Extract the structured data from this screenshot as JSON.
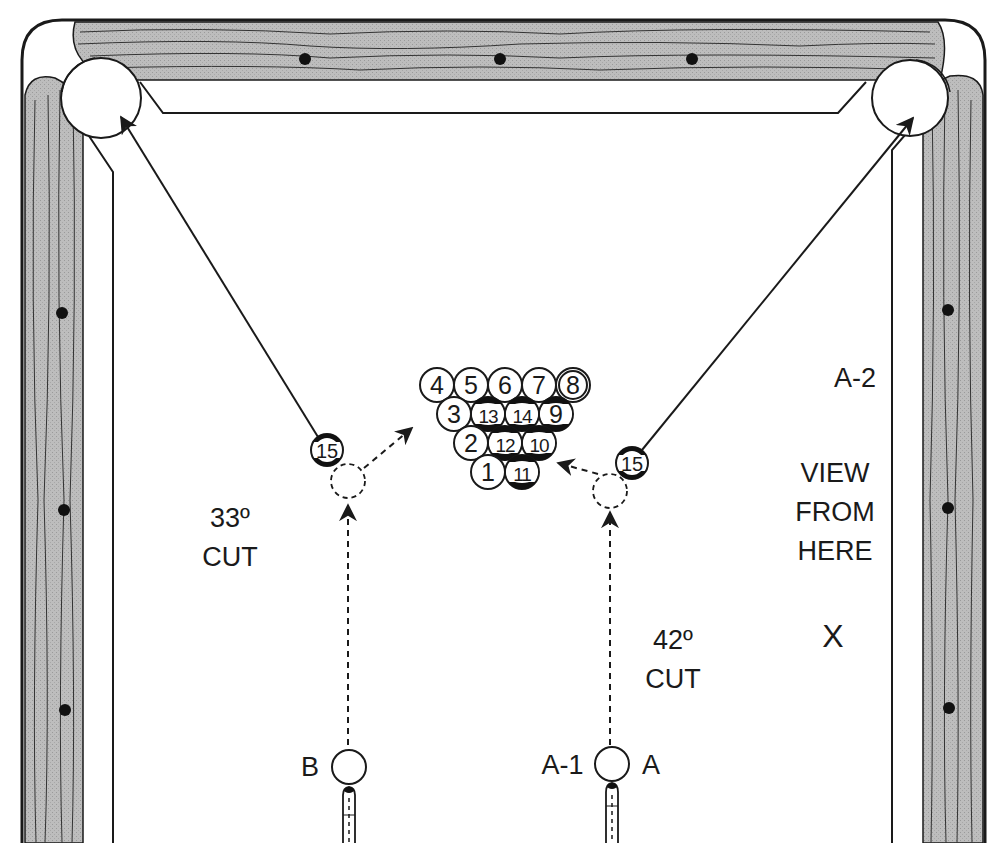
{
  "diagram": {
    "rack": {
      "rows": [
        [
          "4",
          "5",
          "6",
          "7",
          "8"
        ],
        [
          "3",
          "13",
          "14",
          "9"
        ],
        [
          "2",
          "12",
          "10"
        ],
        [
          "1",
          "11"
        ]
      ],
      "stripes": [
        "9",
        "10",
        "11",
        "12",
        "13",
        "14",
        "15"
      ],
      "eight_ball": "8"
    },
    "object_ball_left": {
      "number": "15"
    },
    "object_ball_right": {
      "number": "15"
    },
    "labels": {
      "a2": "A-2",
      "view_line1": "VIEW",
      "view_line2": "FROM",
      "view_line3": "HERE",
      "view_marker": "X",
      "cut_left_angle": "33º",
      "cut_left_word": "CUT",
      "cut_right_angle": "42º",
      "cut_right_word": "CUT",
      "cue_b": "B",
      "cue_a1": "A-1",
      "cue_a": "A"
    },
    "colors": {
      "rail_wood": "#b8b8b8",
      "ink": "#1a1a1a",
      "cloth": "#ffffff"
    }
  }
}
